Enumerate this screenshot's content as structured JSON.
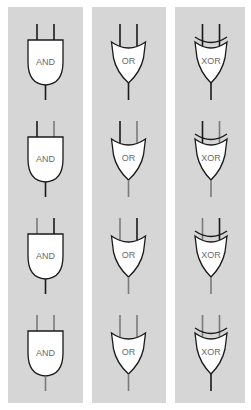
{
  "diagram": {
    "colors": {
      "panel": "#d6d6d6",
      "high": "#1a1a1a",
      "low": "#7a7a7a",
      "gate_fill": "#ffffff",
      "label": "#6a6a6a"
    },
    "columns": [
      {
        "type": "AND",
        "label": "AND"
      },
      {
        "type": "OR",
        "label": "OR"
      },
      {
        "type": "XOR",
        "label": "XOR"
      }
    ],
    "rows": [
      {
        "inputs": [
          1,
          1
        ],
        "outputs": {
          "AND": 1,
          "OR": 1,
          "XOR": 1
        }
      },
      {
        "inputs": [
          1,
          0
        ],
        "outputs": {
          "AND": 1,
          "OR": 0,
          "XOR": 0
        }
      },
      {
        "inputs": [
          0,
          1
        ],
        "outputs": {
          "AND": 1,
          "OR": 0,
          "XOR": 0
        }
      },
      {
        "inputs": [
          0,
          0
        ],
        "outputs": {
          "AND": 0,
          "OR": 0,
          "XOR": 1
        }
      }
    ],
    "labels": {
      "and": "AND",
      "or": "OR",
      "xor": "XOR"
    }
  }
}
